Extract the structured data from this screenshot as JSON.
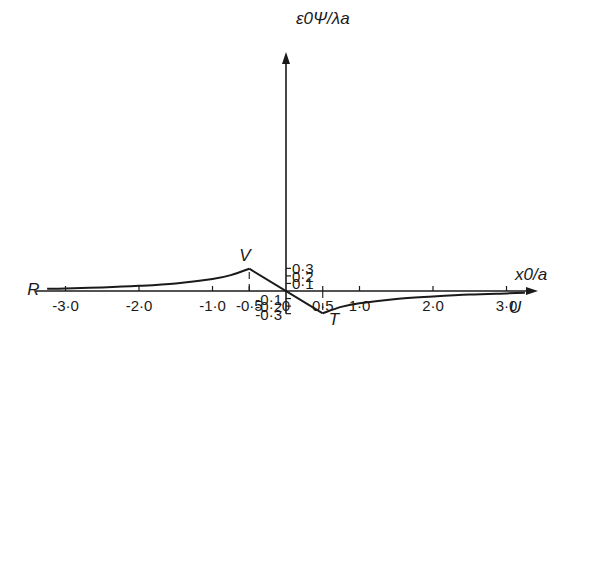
{
  "chart_data": {
    "type": "line",
    "title": "",
    "xlabel": "x0/a",
    "ylabel": "ε0Ψ/λa",
    "xlim": [
      -3.3,
      3.3
    ],
    "ylim": [
      -0.3,
      0.3
    ],
    "grid": false,
    "legend": null,
    "x_ticks": [
      -3.0,
      -2.0,
      -1.0,
      -0.5,
      0.5,
      1.0,
      2.0,
      3.0
    ],
    "x_tick_labels": [
      "-3·0",
      "-2·0",
      "-1·0",
      "-0·5",
      "0·5",
      "1·0",
      "2·0",
      "3·0"
    ],
    "y_ticks": [
      0.3,
      0.2,
      0.1,
      -0.1,
      -0.2,
      -0.3
    ],
    "y_tick_labels": [
      "0·3",
      "0·2",
      "0·1",
      "-0·1",
      "-0·2",
      "-0·3"
    ],
    "series": [
      {
        "name": "Ψ",
        "x": [
          -3.25,
          -3.0,
          -2.5,
          -2.0,
          -1.5,
          -1.0,
          -0.75,
          -0.5,
          0.0,
          0.5,
          0.75,
          1.0,
          1.5,
          2.0,
          2.5,
          3.0,
          3.25
        ],
        "y": [
          0.03,
          0.034,
          0.047,
          0.068,
          0.1,
          0.158,
          0.21,
          0.295,
          0.0,
          -0.295,
          -0.21,
          -0.162,
          -0.105,
          -0.074,
          -0.048,
          -0.032,
          -0.024
        ]
      }
    ],
    "annotations": [
      {
        "label": "R",
        "x": -3.25,
        "y": 0.03
      },
      {
        "label": "V",
        "x": -0.5,
        "y": 0.295
      },
      {
        "label": "T",
        "x": 0.5,
        "y": -0.295
      },
      {
        "label": "U",
        "x": 3.25,
        "y": -0.024
      }
    ],
    "reference_lines": [
      {
        "style": "dashed",
        "x": -0.5,
        "from_y": 0.0,
        "to_y": 0.295
      },
      {
        "style": "dashed",
        "x": 0.5,
        "from_y": 0.0,
        "to_y": -0.295
      }
    ]
  },
  "axes": {
    "x_title": "x0/a",
    "y_title": "ε0Ψ/λa"
  }
}
